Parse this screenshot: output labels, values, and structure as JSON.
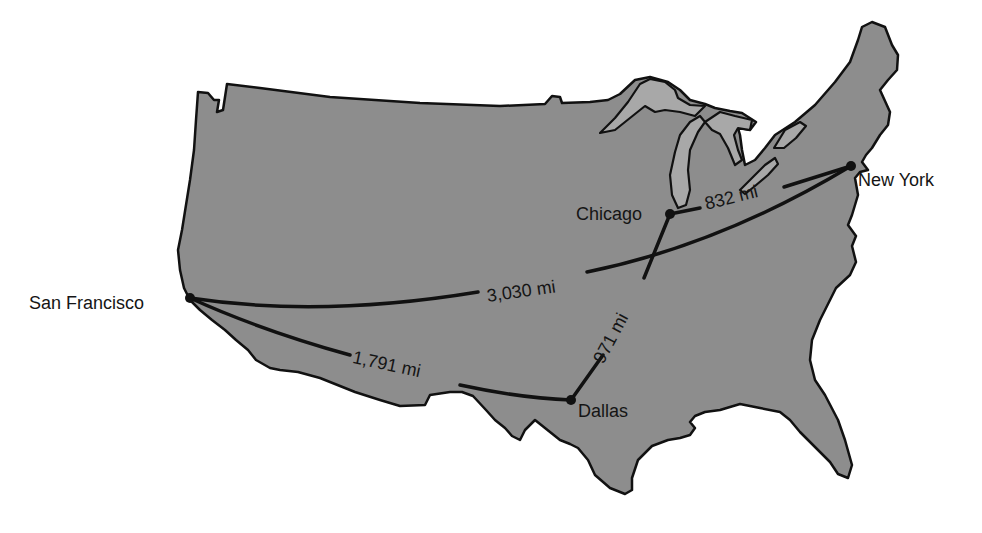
{
  "map": {
    "title": "",
    "region": "Contiguous United States",
    "land_color": "#8d8d8d",
    "lake_color": "#a3a3a3",
    "outline_color": "#111111",
    "route_color": "#111111",
    "background": "#ffffff"
  },
  "cities": [
    {
      "name": "San Francisco",
      "x": 190,
      "y": 298
    },
    {
      "name": "Chicago",
      "x": 670,
      "y": 214
    },
    {
      "name": "New York",
      "x": 851,
      "y": 166
    },
    {
      "name": "Dallas",
      "x": 571,
      "y": 400
    }
  ],
  "routes": [
    {
      "from": "San Francisco",
      "to": "New York",
      "label": "3,030 mi"
    },
    {
      "from": "Chicago",
      "to": "New York",
      "label": "832 mi"
    },
    {
      "from": "Chicago",
      "to": "Dallas",
      "label": "971 mi"
    },
    {
      "from": "San Francisco",
      "to": "Dallas",
      "label": "1,791 mi"
    }
  ]
}
